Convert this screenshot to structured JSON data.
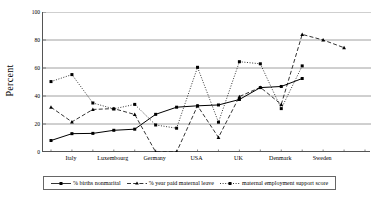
{
  "chart_data": {
    "type": "line",
    "title": "",
    "xlabel": "",
    "ylabel": "Percent",
    "ylim": [
      0,
      100
    ],
    "yticks": [
      0,
      20,
      40,
      60,
      80,
      100
    ],
    "grid": "horizontal",
    "legend_position": "bottom",
    "x": [
      1,
      2,
      3,
      4,
      5,
      6,
      7,
      8,
      9,
      10,
      11,
      12,
      13,
      14,
      15,
      16
    ],
    "categories": [
      "Italy",
      "",
      "Luxembourg",
      "",
      "Germany",
      "",
      "USA",
      "",
      "UK",
      "",
      "Denmark",
      "",
      "Sweden",
      "",
      "",
      ""
    ],
    "xtick_labels": [
      "Italy",
      "Luxembourg",
      "Germany",
      "USA",
      "UK",
      "Denmark",
      "Sweden"
    ],
    "xtick_positions": [
      1,
      3,
      5,
      7,
      9,
      11,
      13
    ],
    "series": [
      {
        "name": "% births nonmarital",
        "style": "solid",
        "marker": "square",
        "values": [
          8.2,
          13.1,
          13.3,
          15.5,
          16.3,
          26.9,
          32.0,
          33.0,
          33.6,
          37.5,
          46.0,
          46.8,
          52.5,
          null,
          null,
          null
        ]
      },
      {
        "name": "% year paid maternal leave",
        "style": "dashed",
        "marker": "triangle",
        "values": [
          32.0,
          21.5,
          30.4,
          31.0,
          26.8,
          0.0,
          0.0,
          33.0,
          10.4,
          39.6,
          46.2,
          34.0,
          84.0,
          80.0,
          74.5,
          null
        ]
      },
      {
        "name": "maternal employment support score",
        "style": "dotted",
        "marker": "square",
        "values": [
          50.3,
          55.3,
          35.0,
          30.8,
          34.0,
          19.3,
          17.0,
          60.5,
          21.3,
          64.5,
          63.0,
          31.0,
          61.5,
          null,
          null,
          null
        ]
      }
    ]
  },
  "legend": {
    "items": [
      {
        "label": "% births nonmarital",
        "style": "solid",
        "marker": "square"
      },
      {
        "label": "% year paid maternal leave",
        "style": "dashed",
        "marker": "triangle"
      },
      {
        "label": "maternal employment support score",
        "style": "dotted",
        "marker": "square"
      }
    ]
  },
  "colors": {
    "line": "#000000",
    "grid": "#888888",
    "axis": "#555555",
    "background": "#ffffff"
  }
}
